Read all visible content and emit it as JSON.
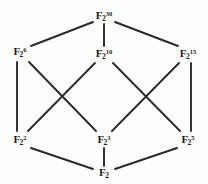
{
  "diagram": {
    "type": "hasse-lattice",
    "background_color": "#fdfdfc",
    "edge_color": "#2a2a2a",
    "text_color": "#1b1b1b",
    "nodes": [
      {
        "id": "f2_30",
        "name": "node-f2-30",
        "base": "F",
        "subscript": "2",
        "superscript": "30",
        "label": "F_2^30",
        "x": 104,
        "y": 16
      },
      {
        "id": "f2_6",
        "name": "node-f2-6",
        "base": "F",
        "subscript": "2",
        "superscript": "6",
        "label": "F_2^6",
        "x": 20,
        "y": 52
      },
      {
        "id": "f2_10",
        "name": "node-f2-10",
        "base": "F",
        "subscript": "2",
        "superscript": "10",
        "label": "F_2^10",
        "x": 104,
        "y": 54
      },
      {
        "id": "f2_15",
        "name": "node-f2-15",
        "base": "F",
        "subscript": "2",
        "superscript": "15",
        "label": "F_2^15",
        "x": 188,
        "y": 54
      },
      {
        "id": "f2_2",
        "name": "node-f2-2",
        "base": "F",
        "subscript": "2",
        "superscript": "2",
        "label": "F_2^2",
        "x": 20,
        "y": 140
      },
      {
        "id": "f2_3",
        "name": "node-f2-3",
        "base": "F",
        "subscript": "2",
        "superscript": "3",
        "label": "F_2^3",
        "x": 104,
        "y": 140
      },
      {
        "id": "f2_5",
        "name": "node-f2-5",
        "base": "F",
        "subscript": "2",
        "superscript": "5",
        "label": "F_2^5",
        "x": 188,
        "y": 140
      },
      {
        "id": "f2_1",
        "name": "node-f2-1",
        "base": "F",
        "subscript": "2",
        "superscript": "",
        "label": "F_2",
        "x": 104,
        "y": 173
      }
    ],
    "edges": [
      {
        "name": "edge-f2-30-to-f2-6",
        "from": "f2_30",
        "to": "f2_6",
        "x1": 93,
        "y1": 22,
        "x2": 31,
        "y2": 46
      },
      {
        "name": "edge-f2-30-to-f2-10",
        "from": "f2_30",
        "to": "f2_10",
        "x1": 104,
        "y1": 24,
        "x2": 104,
        "y2": 46
      },
      {
        "name": "edge-f2-30-to-f2-15",
        "from": "f2_30",
        "to": "f2_15",
        "x1": 115,
        "y1": 22,
        "x2": 178,
        "y2": 46
      },
      {
        "name": "edge-f2-6-to-f2-2",
        "from": "f2_6",
        "to": "f2_2",
        "x1": 17,
        "y1": 62,
        "x2": 17,
        "y2": 131
      },
      {
        "name": "edge-f2-6-to-f2-3",
        "from": "f2_6",
        "to": "f2_3",
        "x1": 29,
        "y1": 62,
        "x2": 96,
        "y2": 131
      },
      {
        "name": "edge-f2-10-to-f2-2",
        "from": "f2_10",
        "to": "f2_2",
        "x1": 95,
        "y1": 63,
        "x2": 28,
        "y2": 131
      },
      {
        "name": "edge-f2-10-to-f2-5",
        "from": "f2_10",
        "to": "f2_5",
        "x1": 113,
        "y1": 63,
        "x2": 180,
        "y2": 131
      },
      {
        "name": "edge-f2-15-to-f2-3",
        "from": "f2_15",
        "to": "f2_3",
        "x1": 179,
        "y1": 63,
        "x2": 112,
        "y2": 131
      },
      {
        "name": "edge-f2-15-to-f2-5",
        "from": "f2_15",
        "to": "f2_5",
        "x1": 191,
        "y1": 63,
        "x2": 191,
        "y2": 131
      },
      {
        "name": "edge-f2-2-to-f2-1",
        "from": "f2_2",
        "to": "f2_1",
        "x1": 31,
        "y1": 148,
        "x2": 93,
        "y2": 169
      },
      {
        "name": "edge-f2-3-to-f2-1",
        "from": "f2_3",
        "to": "f2_1",
        "x1": 104,
        "y1": 148,
        "x2": 104,
        "y2": 167
      },
      {
        "name": "edge-f2-5-to-f2-1",
        "from": "f2_5",
        "to": "f2_1",
        "x1": 177,
        "y1": 148,
        "x2": 115,
        "y2": 169
      }
    ]
  }
}
